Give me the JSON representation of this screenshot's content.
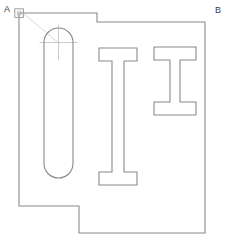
{
  "drawing": {
    "title": "Mechanical part outline drawing",
    "canvas": {
      "width": 228,
      "height": 251,
      "background": "#ffffff"
    },
    "style": {
      "outline_color": "#8a8a8a",
      "outline_width": 1.1,
      "feature_color": "#8a8a8a",
      "feature_width": 1.1,
      "construction_color": "#c4c4c4",
      "construction_width": 0.7,
      "centerline_color": "#b0b0b0",
      "centerline_width": 0.7,
      "marker_color": "#9a9a9a",
      "label_color": "#3a3a3a"
    },
    "labels": [
      {
        "id": "a",
        "text": "A",
        "x": 4,
        "y": 5
      },
      {
        "id": "b",
        "text": "B",
        "x": 215,
        "y": 6
      }
    ],
    "outline": {
      "name": "part-outline",
      "points": "19,13 97,13 97,22 205,22 205,233 79,233 79,206 19,206",
      "closed": true
    },
    "slot": {
      "name": "rounded-slot",
      "x": 44,
      "y": 28,
      "width": 29,
      "height": 150,
      "radius": 14.5
    },
    "ibeam_tall": {
      "name": "i-beam-tall",
      "points": "99,48 137,48 137,61 124,61 124,172 137,172 137,185 99,185 99,172 112,172 112,61 99,61"
    },
    "ibeam_short": {
      "name": "i-beam-short",
      "points": "154,47 196,47 196,60 180,60 180,102 196,102 196,115 154,115 154,102 170,102 170,60 154,60"
    },
    "construction_line": {
      "name": "construction-line",
      "x1": 24,
      "y1": 14,
      "x2": 60,
      "y2": 44
    },
    "corner_marker": {
      "name": "corner-marker-a",
      "x": 19,
      "y": 9,
      "size": 9
    },
    "center_mark": {
      "name": "slot-center-mark",
      "cx": 58.5,
      "cy": 42.5,
      "h_half": 19,
      "v_half": 18
    }
  }
}
